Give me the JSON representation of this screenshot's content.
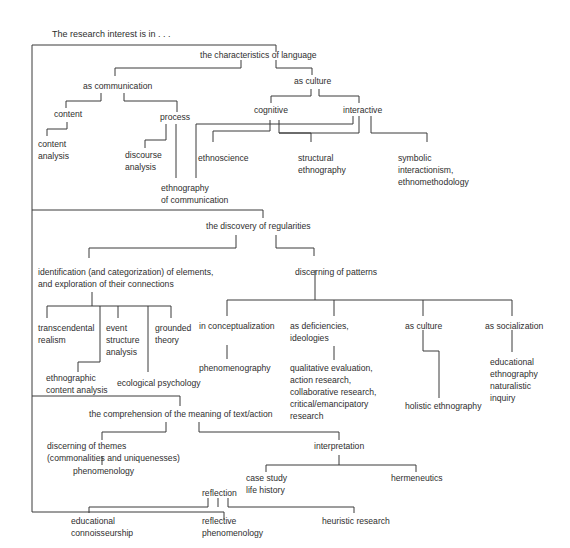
{
  "diagram": {
    "title": "The research interest is in . . .",
    "nodes": {
      "characteristics_of_language": [
        "the characteristics of language"
      ],
      "as_communication": [
        "as communication"
      ],
      "content": [
        "content"
      ],
      "content_analysis": [
        "content",
        "analysis"
      ],
      "process": [
        "process"
      ],
      "discourse_analysis": [
        "discourse",
        "analysis"
      ],
      "ethnography_of_communication": [
        "ethnography",
        "of communication"
      ],
      "as_culture_lang": [
        "as culture"
      ],
      "cognitive": [
        "cognitive"
      ],
      "interactive": [
        "interactive"
      ],
      "ethnoscience": [
        "ethnoscience"
      ],
      "structural_ethnography": [
        "structural",
        "ethnography"
      ],
      "symbolic_interactionism": [
        "symbolic",
        "interactionism,",
        "ethnomethodology"
      ],
      "discovery_of_regularities": [
        "the discovery of regularities"
      ],
      "identification_of_elements": [
        "identification (and categorization) of elements,",
        "and exploration of their connections"
      ],
      "discerning_of_patterns": [
        "discerning of patterns"
      ],
      "transcendental_realism": [
        "transcendental",
        "realism"
      ],
      "event_structure_analysis": [
        "event",
        "structure",
        "analysis"
      ],
      "grounded_theory": [
        "grounded",
        "theory"
      ],
      "ethnographic_content_analysis": [
        "ethnographic",
        "content analysis"
      ],
      "ecological_psychology": [
        "ecological psychology"
      ],
      "in_conceptualization": [
        "in conceptualization"
      ],
      "phenomenography": [
        "phenomenography"
      ],
      "as_deficiencies_ideologies": [
        "as deficiencies,",
        "ideologies"
      ],
      "qualitative_evaluation": [
        "qualitative evaluation,",
        "action research,",
        "collaborative research,",
        "critical/emancipatory",
        "research"
      ],
      "as_culture_patterns": [
        "as culture"
      ],
      "holistic_ethnography": [
        "holistic ethnography"
      ],
      "as_socialization": [
        "as socialization"
      ],
      "educational_ethnography": [
        "educational",
        "ethnography",
        "naturalistic",
        "inquiry"
      ],
      "comprehension_of_meaning": [
        "the comprehension of the meaning of text/action"
      ],
      "discerning_of_themes": [
        "discerning of themes",
        "(commonalities and uniquenesses)"
      ],
      "phenomenology": [
        "phenomenology"
      ],
      "interpretation": [
        "interpretation"
      ],
      "case_study_life_history": [
        "case study",
        "life history"
      ],
      "hermeneutics": [
        "hermeneutics"
      ],
      "reflection": [
        "reflection"
      ],
      "educational_connoisseurship": [
        "educational",
        "connoisseurship"
      ],
      "reflective_phenomenology": [
        "reflective",
        "phenomenology"
      ],
      "heuristic_research": [
        "heuristic research"
      ]
    },
    "colors": {
      "text": "#2e2e2e",
      "lines": "#3a3a3a",
      "background": "#ffffff"
    }
  }
}
